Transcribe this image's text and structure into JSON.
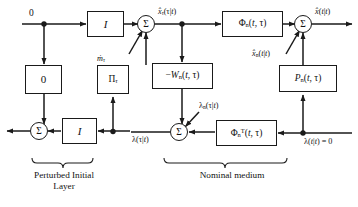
{
  "diagram": {
    "line_color": "#1a1a1a",
    "background": "#ffffff"
  },
  "blocks": [
    {
      "id": "identity-top-left",
      "label": "I",
      "x": 87,
      "y": 11,
      "w": 37,
      "h": 26
    },
    {
      "id": "zero-gain",
      "label": "0",
      "x": 25,
      "y": 65,
      "w": 37,
      "h": 29
    },
    {
      "id": "pi-tau",
      "label": "Πτ",
      "x": 97,
      "y": 65,
      "w": 32,
      "h": 29
    },
    {
      "id": "minus-wn",
      "label": "−Wn(t, τ)",
      "x": 152,
      "y": 63,
      "w": 61,
      "h": 26
    },
    {
      "id": "phi-n",
      "label": "Φn(t, τ)",
      "x": 222,
      "y": 11,
      "w": 61,
      "h": 26
    },
    {
      "id": "p-n",
      "label": "Pn(t, τ)",
      "x": 279,
      "y": 65,
      "w": 58,
      "h": 27
    },
    {
      "id": "phi-n-transpose",
      "label": "ΦnT(t, τ)",
      "x": 216,
      "y": 120,
      "w": 61,
      "h": 26
    },
    {
      "id": "identity-bottom-left",
      "label": "I",
      "x": 62,
      "y": 118,
      "w": 35,
      "h": 26
    }
  ],
  "summers": [
    {
      "id": "summer-top-left",
      "label": "Σ",
      "cx": 146,
      "cy": 24
    },
    {
      "id": "summer-top-right",
      "label": "Σ",
      "cx": 303,
      "cy": 24
    },
    {
      "id": "summer-bottom-left",
      "label": "Σ",
      "cx": 39,
      "cy": 131
    },
    {
      "id": "summer-bottom-middle",
      "label": "Σ",
      "cx": 179,
      "cy": 132
    }
  ],
  "labels": {
    "input_zero_top": "0",
    "m_dot_tau": "ṁτ",
    "x_hat_tau": "x̂τ(τ|t)",
    "x_hat_out": "x̂(t|t)",
    "x_hat_n": "x̂n(t|t)",
    "lambda_tau": "λ(τ|t)",
    "lambda_n_tau": "λn(τ|t)",
    "lambda_t_zero": "λ(t|t) = 0"
  },
  "captions": {
    "perturbed_initial_layer": "Perturbed Initial\nLayer",
    "nominal_medium": "Nominal medium"
  }
}
